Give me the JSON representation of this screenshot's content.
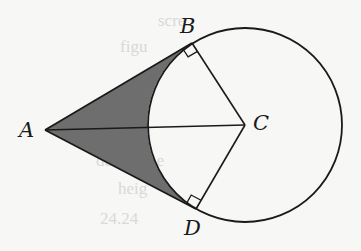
{
  "figure": {
    "points": {
      "A": {
        "label": "A",
        "x": 45,
        "y": 130
      },
      "B": {
        "label": "B",
        "x": 192,
        "y": 43
      },
      "C": {
        "label": "C",
        "x": 245,
        "y": 125
      },
      "D": {
        "label": "D",
        "x": 196,
        "y": 209
      }
    },
    "circle": {
      "center": "C",
      "cx": 245,
      "cy": 125,
      "r": 97
    },
    "segments": [
      "AB",
      "AD",
      "AC",
      "CB",
      "CD"
    ],
    "right_angles": [
      "ABC",
      "ADC"
    ],
    "shaded_region": "region bounded by AB, AD and minor arc BD",
    "colors": {
      "background": "#f7f7f5",
      "stroke": "#1a1a1a",
      "shade": "#6e6e6e"
    }
  },
  "bleed_through_text": [
    "scre",
    "figu",
    "is",
    "ma",
    "determine",
    "heig",
    "24.24"
  ]
}
